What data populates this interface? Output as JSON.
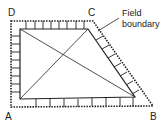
{
  "diagram": {
    "type": "field survey triangulation sketch",
    "labels": {
      "A": "A",
      "B": "B",
      "C": "C",
      "D": "D"
    },
    "annotation": {
      "line1": "Field",
      "line2": "boundary"
    },
    "colors": {
      "ink": "#222222",
      "background": "#ffffff"
    }
  }
}
